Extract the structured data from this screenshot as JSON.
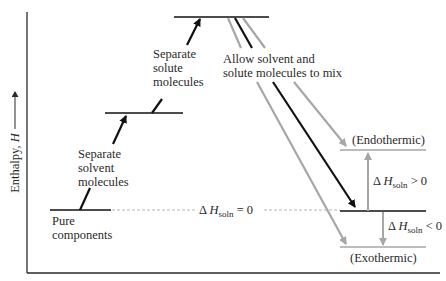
{
  "diagram": {
    "type": "enthalpy-level-diagram",
    "y_axis_label": "Enthalpy, ",
    "y_axis_symbol": "H",
    "colors": {
      "axis": "#2a2a2a",
      "black_path": "#111111",
      "gray_path": "#a6a6a6",
      "dashed": "#b5b5b5",
      "text": "#2a2a2a"
    },
    "levels": [
      {
        "name": "pure-components",
        "label_lines": [
          "Pure",
          "components"
        ]
      },
      {
        "name": "separated-solvent",
        "label_lines": [
          "Separate",
          "solvent",
          "molecules"
        ]
      },
      {
        "name": "separated-solute",
        "label_lines": [
          "Separate",
          "solute",
          "molecules"
        ]
      },
      {
        "name": "mix",
        "label_lines": [
          "Allow solvent and",
          "solute molecules to mix"
        ]
      },
      {
        "name": "endothermic",
        "label": "(Endothermic)"
      },
      {
        "name": "exothermic",
        "label": "(Exothermic)"
      }
    ],
    "delta_labels": {
      "zero": {
        "prefix": "Δ ",
        "symbol": "H",
        "sub": "soln",
        "suffix": " = 0"
      },
      "positive": {
        "prefix": "Δ ",
        "symbol": "H",
        "sub": "soln",
        "suffix": " > 0"
      },
      "negative": {
        "prefix": "Δ ",
        "symbol": "H",
        "sub": "soln",
        "suffix": " < 0"
      }
    }
  }
}
